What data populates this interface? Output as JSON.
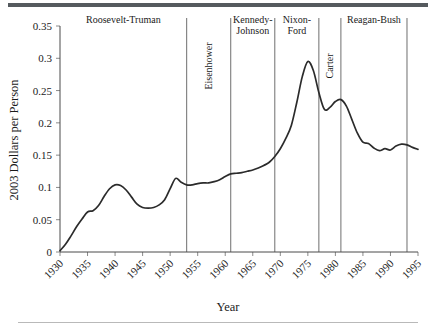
{
  "figure": {
    "ylabel": "2003 Dollars per Person",
    "xlabel": "Year"
  },
  "chart_data": {
    "type": "line",
    "title": "",
    "xlabel": "Year",
    "ylabel": "2003 Dollars per Person",
    "xlim": [
      1930,
      1995
    ],
    "ylim": [
      0,
      0.35
    ],
    "grid": false,
    "legend": null,
    "xticks": [
      "1930",
      "1935",
      "1940",
      "1945",
      "1950",
      "1955",
      "1960",
      "1965",
      "1970",
      "1975",
      "1980",
      "1985",
      "1990",
      "1995"
    ],
    "xtick_values": [
      1930,
      1935,
      1940,
      1945,
      1950,
      1955,
      1960,
      1965,
      1970,
      1975,
      1980,
      1985,
      1990,
      1995
    ],
    "yticks": [
      "0",
      "0.05",
      "0.1",
      "0.15",
      "0.2",
      "0.25",
      "0.3",
      "0.35"
    ],
    "ytick_values": [
      0,
      0.05,
      0.1,
      0.15,
      0.2,
      0.25,
      0.3,
      0.35
    ],
    "series": [
      {
        "name": "2003 Dollars per Person",
        "color": "#2b2b2b",
        "x": [
          1930,
          1931,
          1932,
          1933,
          1934,
          1935,
          1936,
          1937,
          1938,
          1939,
          1940,
          1941,
          1942,
          1943,
          1944,
          1945,
          1946,
          1947,
          1948,
          1949,
          1950,
          1951,
          1952,
          1953,
          1954,
          1955,
          1956,
          1957,
          1958,
          1959,
          1960,
          1961,
          1962,
          1963,
          1964,
          1965,
          1966,
          1967,
          1968,
          1969,
          1970,
          1971,
          1972,
          1973,
          1974,
          1975,
          1976,
          1977,
          1978,
          1979,
          1980,
          1981,
          1982,
          1983,
          1984,
          1985,
          1986,
          1987,
          1988,
          1989,
          1990,
          1991,
          1992,
          1993,
          1994,
          1995
        ],
        "y": [
          0.002,
          0.012,
          0.025,
          0.039,
          0.051,
          0.062,
          0.064,
          0.072,
          0.086,
          0.098,
          0.104,
          0.103,
          0.096,
          0.085,
          0.074,
          0.069,
          0.068,
          0.069,
          0.073,
          0.081,
          0.098,
          0.114,
          0.108,
          0.104,
          0.104,
          0.106,
          0.107,
          0.107,
          0.109,
          0.112,
          0.117,
          0.121,
          0.122,
          0.123,
          0.125,
          0.127,
          0.13,
          0.134,
          0.139,
          0.148,
          0.16,
          0.176,
          0.196,
          0.232,
          0.272,
          0.295,
          0.281,
          0.247,
          0.221,
          0.224,
          0.233,
          0.236,
          0.226,
          0.205,
          0.184,
          0.17,
          0.168,
          0.161,
          0.157,
          0.16,
          0.158,
          0.164,
          0.167,
          0.166,
          0.162,
          0.159
        ]
      }
    ],
    "eras": [
      {
        "label": "Roosevelt-Truman",
        "orientation": "horizontal",
        "start": 1930,
        "end": 1953,
        "label_lines": [
          "Roosevelt-Truman"
        ]
      },
      {
        "label": "Eisenhower",
        "orientation": "vertical",
        "start": 1953,
        "end": 1961,
        "label_lines": [
          "Eisenhower"
        ]
      },
      {
        "label": "Kennedy-Johnson",
        "orientation": "horizontal",
        "start": 1961,
        "end": 1969,
        "label_lines": [
          "Kennedy-",
          "Johnson"
        ]
      },
      {
        "label": "Nixon-Ford",
        "orientation": "horizontal",
        "start": 1969,
        "end": 1977,
        "label_lines": [
          "Nixon-",
          "Ford"
        ]
      },
      {
        "label": "Carter",
        "orientation": "vertical",
        "start": 1977,
        "end": 1981,
        "label_lines": [
          "Carter"
        ]
      },
      {
        "label": "Reagan-Bush",
        "orientation": "horizontal",
        "start": 1981,
        "end": 1993,
        "label_lines": [
          "Reagan-Bush"
        ]
      }
    ],
    "divider_years": [
      1953,
      1961,
      1969,
      1977,
      1981,
      1993
    ]
  }
}
